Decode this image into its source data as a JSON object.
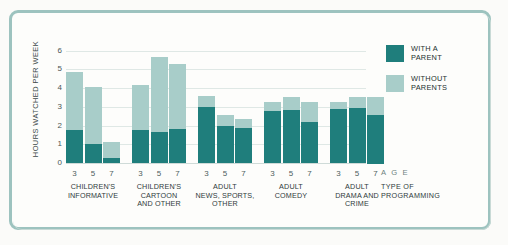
{
  "chart_data": {
    "type": "bar",
    "subtype": "stacked",
    "title": "",
    "xlabel": "TYPE OF PROGRAMMING",
    "ylabel": "HOURS WATCHED PER WEEK",
    "ylim": [
      0,
      6.4
    ],
    "yticks": [
      0,
      1,
      2,
      3,
      4,
      5,
      6
    ],
    "ytick_labels": [
      "0",
      "1",
      "2",
      "3",
      "4",
      "5",
      "6"
    ],
    "grid": true,
    "legend_position": "right-top",
    "age_axis_label": "A G E",
    "age_ticks": [
      "3",
      "5",
      "7"
    ],
    "series": [
      {
        "name": "WITH A PARENT",
        "color": "#1f7e7c",
        "values": [
          1.8,
          1.05,
          0.3,
          1.8,
          1.7,
          1.85,
          3.05,
          2.05,
          1.9,
          2.85,
          2.9,
          2.25,
          2.95,
          3.0,
          2.6
        ]
      },
      {
        "name": "WITHOUT PARENTS",
        "color": "#a8cdc9",
        "values": [
          3.1,
          3.05,
          0.9,
          2.4,
          4.0,
          3.5,
          0.6,
          0.55,
          0.5,
          0.45,
          0.7,
          1.05,
          0.35,
          0.6,
          0.95
        ]
      }
    ],
    "totals": [
      4.9,
      4.1,
      1.2,
      4.2,
      5.7,
      5.35,
      3.65,
      2.6,
      2.4,
      3.3,
      3.6,
      3.3,
      3.3,
      3.6,
      3.55
    ],
    "groups": [
      {
        "label": "CHILDREN'S\nINFORMATIVE",
        "ages": [
          "3",
          "5",
          "7"
        ]
      },
      {
        "label": "CHILDREN'S\nCARTOON\nAND OTHER",
        "ages": [
          "3",
          "5",
          "7"
        ]
      },
      {
        "label": "ADULT\nNEWS, SPORTS,\nOTHER",
        "ages": [
          "3",
          "5",
          "7"
        ]
      },
      {
        "label": "ADULT\nCOMEDY",
        "ages": [
          "3",
          "5",
          "7"
        ]
      },
      {
        "label": "ADULT\nDRAMA AND\nCRIME",
        "ages": [
          "3",
          "5",
          "7"
        ]
      }
    ]
  },
  "legend": {
    "items": [
      {
        "label": "WITH A\nPARENT",
        "color": "#1f7e7c"
      },
      {
        "label": "WITHOUT\nPARENTS",
        "color": "#a8cdc9"
      }
    ]
  },
  "axes": {
    "y_title": "HOURS WATCHED PER WEEK",
    "age_caption": "A G E",
    "type_caption": "TYPE OF\nPROGRAMMING"
  },
  "colors": {
    "dark_teal": "#1f7e7c",
    "light_teal": "#a8cdc9",
    "frame": "#9dc3bf",
    "grid": "#dfe8e5",
    "background": "#fdfdfb",
    "text": "#2f3b3b"
  }
}
